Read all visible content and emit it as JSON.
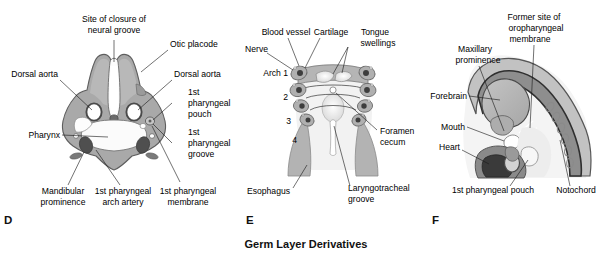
{
  "figure": {
    "caption": "Germ Layer Derivatives",
    "background": "#ffffff",
    "palette": {
      "tissue_light": "#c9c9c9",
      "tissue_mid": "#a9a9a9",
      "tissue_dark": "#8a8a8a",
      "tissue_darker": "#6e6e6e",
      "cavity_white": "#fdfdfd",
      "outline": "#4a4a4a",
      "ink": "#000000"
    }
  },
  "panels": [
    {
      "letter": "D",
      "name": "pharyngeal-region-transverse-section",
      "labels": [
        {
          "id": "site-of-closure-of-neural-groove",
          "lines": [
            "Site of closure of",
            "neural groove"
          ]
        },
        {
          "id": "otic-placode",
          "lines": [
            "Otic placode"
          ]
        },
        {
          "id": "dorsal-aorta-left",
          "lines": [
            "Dorsal aorta"
          ]
        },
        {
          "id": "dorsal-aorta-right",
          "lines": [
            "Dorsal aorta"
          ]
        },
        {
          "id": "first-pharyngeal-pouch",
          "lines": [
            "1st",
            "pharyngeal",
            "pouch"
          ]
        },
        {
          "id": "first-pharyngeal-groove",
          "lines": [
            "1st",
            "pharyngeal",
            "groove"
          ]
        },
        {
          "id": "pharynx",
          "lines": [
            "Pharynx"
          ]
        },
        {
          "id": "mandibular-prominence",
          "lines": [
            "Mandibular",
            "prominence"
          ]
        },
        {
          "id": "first-pharyngeal-arch-artery",
          "lines": [
            "1st pharyngeal",
            "arch artery"
          ]
        },
        {
          "id": "first-pharyngeal-membrane",
          "lines": [
            "1st pharyngeal",
            "membrane"
          ]
        }
      ]
    },
    {
      "letter": "E",
      "name": "floor-of-pharynx-view",
      "labels": [
        {
          "id": "blood-vessel",
          "lines": [
            "Blood vessel"
          ]
        },
        {
          "id": "cartilage",
          "lines": [
            "Cartilage"
          ]
        },
        {
          "id": "tongue-swellings",
          "lines": [
            "Tongue",
            "swellings"
          ]
        },
        {
          "id": "nerve",
          "lines": [
            "Nerve"
          ]
        },
        {
          "id": "arch-1",
          "lines": [
            "Arch 1"
          ]
        },
        {
          "id": "arch-2",
          "lines": [
            "2"
          ]
        },
        {
          "id": "arch-3",
          "lines": [
            "3"
          ]
        },
        {
          "id": "arch-4",
          "lines": [
            "4"
          ]
        },
        {
          "id": "foramen-cecum",
          "lines": [
            "Foramen",
            "cecum"
          ]
        },
        {
          "id": "esophagus",
          "lines": [
            "Esophagus"
          ]
        },
        {
          "id": "laryngotracheal-groove",
          "lines": [
            "Laryngotracheal",
            "groove"
          ]
        }
      ]
    },
    {
      "letter": "F",
      "name": "embryo-head-sagittal-section",
      "labels": [
        {
          "id": "former-site-of-oropharyngeal-membrane",
          "lines": [
            "Former site of",
            "oropharyngeal",
            "membrane"
          ]
        },
        {
          "id": "maxillary-prominence",
          "lines": [
            "Maxillary",
            "prominence"
          ]
        },
        {
          "id": "forebrain",
          "lines": [
            "Forebrain"
          ]
        },
        {
          "id": "mouth",
          "lines": [
            "Mouth"
          ]
        },
        {
          "id": "heart",
          "lines": [
            "Heart"
          ]
        },
        {
          "id": "first-pharyngeal-pouch",
          "lines": [
            "1st pharyngeal pouch"
          ]
        },
        {
          "id": "notochord",
          "lines": [
            "Notochord"
          ]
        }
      ]
    }
  ],
  "text": {
    "d": {
      "neural_groove_1": "Site of closure of",
      "neural_groove_2": "neural groove",
      "otic_placode": "Otic placode",
      "dorsal_aorta_l": "Dorsal aorta",
      "dorsal_aorta_r": "Dorsal aorta",
      "pouch_1": "1st",
      "pouch_2": "pharyngeal",
      "pouch_3": "pouch",
      "groove_1": "1st",
      "groove_2": "pharyngeal",
      "groove_3": "groove",
      "pharynx": "Pharynx",
      "mandibular_1": "Mandibular",
      "mandibular_2": "prominence",
      "arch_artery_1": "1st pharyngeal",
      "arch_artery_2": "arch artery",
      "membrane_1": "1st pharyngeal",
      "membrane_2": "membrane",
      "letter": "D"
    },
    "e": {
      "blood_vessel": "Blood vessel",
      "cartilage": "Cartilage",
      "tongue_1": "Tongue",
      "tongue_2": "swellings",
      "nerve": "Nerve",
      "arch1": "Arch 1",
      "arch2": "2",
      "arch3": "3",
      "arch4": "4",
      "foramen_1": "Foramen",
      "foramen_2": "cecum",
      "esophagus": "Esophagus",
      "laryngo_1": "Laryngotracheal",
      "laryngo_2": "groove",
      "letter": "E"
    },
    "f": {
      "former_1": "Former site of",
      "former_2": "oropharyngeal",
      "former_3": "membrane",
      "maxillary_1": "Maxillary",
      "maxillary_2": "prominence",
      "forebrain": "Forebrain",
      "mouth": "Mouth",
      "heart": "Heart",
      "pouch": "1st pharyngeal pouch",
      "notochord": "Notochord",
      "letter": "F"
    },
    "caption": "Germ Layer Derivatives"
  }
}
